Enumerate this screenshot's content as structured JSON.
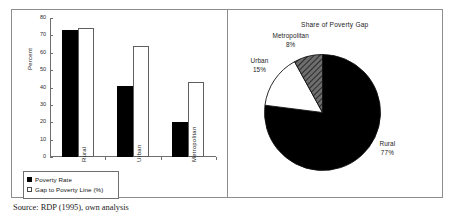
{
  "figure": {
    "source_note": "Source: RDP (1995), own analysis"
  },
  "bar_panel": {
    "ylabel": "Percent",
    "yticks": [
      "0",
      "10",
      "20",
      "30",
      "40",
      "50",
      "60",
      "70",
      "80"
    ],
    "categories": [
      "Rural",
      "Urban",
      "Metropolitan"
    ],
    "legend": [
      {
        "label": "Poverty Rate",
        "color": "#000000"
      },
      {
        "label": "Gap to Poverty Line (%)",
        "color": "#ffffff"
      }
    ]
  },
  "pie_panel": {
    "title": "Share of Poverty Gap",
    "callouts": [
      {
        "name": "Metropolitan",
        "pct": "8%"
      },
      {
        "name": "Urban",
        "pct": "15%"
      },
      {
        "name": "Rural",
        "pct": "77%"
      }
    ]
  },
  "chart_data": [
    {
      "type": "bar",
      "title": "",
      "xlabel": "",
      "ylabel": "Percent",
      "ylim": [
        0,
        80
      ],
      "ytick_step": 10,
      "grid": false,
      "legend_position": "below-left",
      "categories": [
        "Rural",
        "Urban",
        "Metropolitan"
      ],
      "series": [
        {
          "name": "Poverty Rate",
          "color": "#000000",
          "values": [
            73,
            41,
            20
          ]
        },
        {
          "name": "Gap to Poverty Line (%)",
          "color": "#ffffff",
          "values": [
            74,
            64,
            43
          ]
        }
      ]
    },
    {
      "type": "pie",
      "title": "Share of Poverty Gap",
      "labels": [
        "Rural",
        "Urban",
        "Metropolitan"
      ],
      "values": [
        77,
        15,
        8
      ],
      "value_unit": "%",
      "colors": [
        "#000000",
        "#ffffff",
        "#8a8a8a"
      ],
      "legend_position": "callouts"
    }
  ]
}
